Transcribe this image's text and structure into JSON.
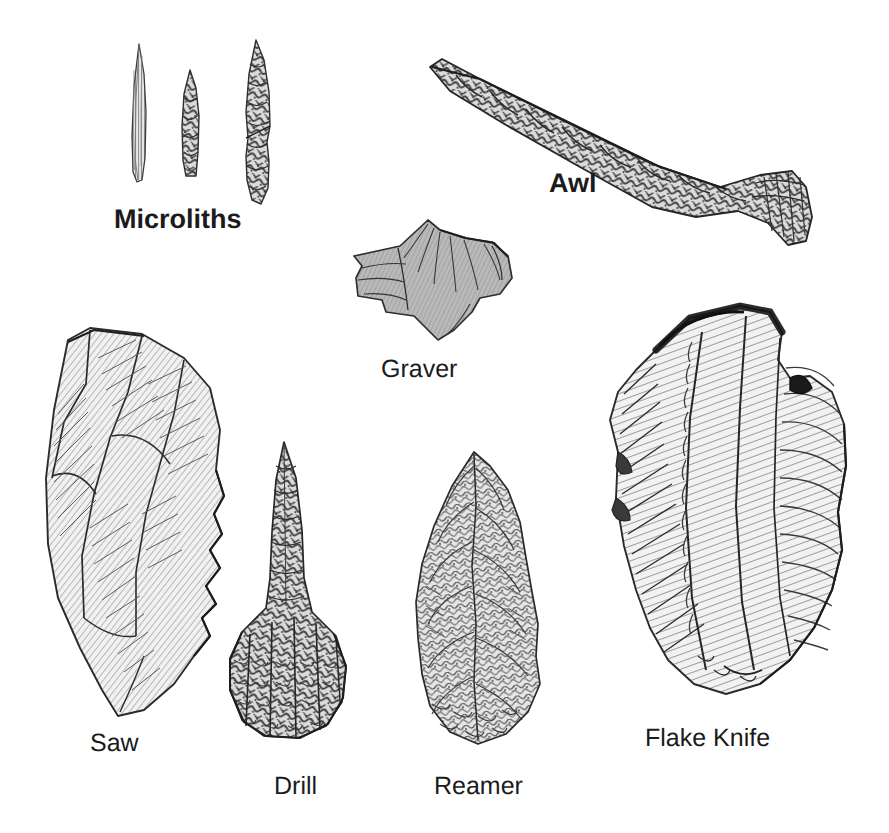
{
  "plate": {
    "kind": "archaeological-illustration-plate",
    "title_visible": false,
    "background_color": "#ffffff",
    "ink_color": "#1b1b1b",
    "width": 889,
    "height": 833,
    "style": "pen-and-ink hatched line drawing, grayscale halftone"
  },
  "labels": [
    {
      "id": "microliths",
      "text": "Microliths",
      "x": 114,
      "y": 206,
      "font_size": 27,
      "weight": "bold",
      "color": "#1b1b1b"
    },
    {
      "id": "awl",
      "text": "Awl",
      "x": 549,
      "y": 170,
      "font_size": 27,
      "weight": "bold",
      "color": "#1b1b1b"
    },
    {
      "id": "graver",
      "text": "Graver",
      "x": 381,
      "y": 357,
      "font_size": 25,
      "weight": "normal",
      "color": "#1b1b1b"
    },
    {
      "id": "saw",
      "text": "Saw",
      "x": 90,
      "y": 731,
      "font_size": 25,
      "weight": "normal",
      "color": "#1b1b1b"
    },
    {
      "id": "drill",
      "text": "Drill",
      "x": 274,
      "y": 774,
      "font_size": 25,
      "weight": "normal",
      "color": "#1b1b1b"
    },
    {
      "id": "reamer",
      "text": "Reamer",
      "x": 434,
      "y": 774,
      "font_size": 25,
      "weight": "normal",
      "color": "#1b1b1b"
    },
    {
      "id": "flake-knife",
      "text": "Flake Knife",
      "x": 645,
      "y": 726,
      "font_size": 25,
      "weight": "normal",
      "color": "#1b1b1b"
    }
  ],
  "artifacts": [
    {
      "id": "microlith-1",
      "name": "Microlith (slender blade)",
      "group": "microliths",
      "x": 128,
      "y": 48,
      "width": 22,
      "height": 128,
      "shading": "fine vertical hatching, light gray"
    },
    {
      "id": "microlith-2",
      "name": "Microlith (short retouched point)",
      "group": "microliths",
      "x": 178,
      "y": 72,
      "width": 26,
      "height": 104,
      "shading": "dark stipple with flake scars"
    },
    {
      "id": "microlith-3",
      "name": "Microlith (long retouched point)",
      "group": "microliths",
      "x": 240,
      "y": 42,
      "width": 42,
      "height": 158,
      "shading": "dark stipple with flake scars"
    },
    {
      "id": "awl",
      "name": "Awl",
      "x": 430,
      "y": 55,
      "width": 390,
      "height": 190,
      "shading": "mottled dark gray flake-scar texture",
      "orientation": "diagonal, point upper-left, flared base lower-right"
    },
    {
      "id": "graver",
      "name": "Graver",
      "x": 345,
      "y": 218,
      "width": 175,
      "height": 125,
      "shading": "mid-gray flake with fine radiating lines"
    },
    {
      "id": "saw",
      "name": "Saw",
      "x": 30,
      "y": 325,
      "width": 200,
      "height": 400,
      "shading": "light gray with long diagonal hatch, serrated right edge"
    },
    {
      "id": "drill",
      "name": "Drill",
      "x": 222,
      "y": 440,
      "width": 140,
      "height": 320,
      "shading": "mottled flake-scar texture, narrow shaft with wide base"
    },
    {
      "id": "reamer",
      "name": "Reamer",
      "x": 400,
      "y": 450,
      "width": 135,
      "height": 310,
      "shading": "mottled bifacial flake scars, teardrop outline"
    },
    {
      "id": "flake-knife",
      "name": "Flake Knife",
      "x": 600,
      "y": 305,
      "width": 260,
      "height": 410,
      "shading": "dense curved hatching, dark cortex along top edge"
    }
  ]
}
